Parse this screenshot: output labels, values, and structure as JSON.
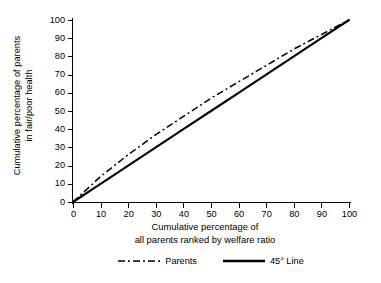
{
  "chart_data": {
    "type": "line",
    "title": "",
    "xlabel": "Cumulative percentage of all parents ranked by welfare ratio",
    "xlabel_line1": "Cumulative percentage of",
    "xlabel_line2": "all parents ranked by welfare ratio",
    "ylabel": "Cumulative percentage of parents in fair/poor health",
    "ylabel_line1": "Cumulative percentage of parents",
    "ylabel_line2": "in fair/poor health",
    "xlim": [
      0,
      100
    ],
    "ylim": [
      0,
      100
    ],
    "xticks": [
      "0",
      "10",
      "20",
      "30",
      "40",
      "50",
      "60",
      "70",
      "80",
      "90",
      "100"
    ],
    "yticks": [
      "0",
      "10",
      "20",
      "30",
      "40",
      "50",
      "60",
      "70",
      "80",
      "90",
      "100"
    ],
    "grid": false,
    "legend_position": "bottom-center",
    "x": [
      0,
      10,
      20,
      30,
      40,
      50,
      60,
      70,
      80,
      90,
      100
    ],
    "series": [
      {
        "name": "Parents",
        "style": "dash-dot",
        "color": "#000000",
        "values": [
          0,
          14,
          26,
          37,
          47,
          57,
          66,
          75,
          84,
          92,
          100
        ]
      },
      {
        "name": "45° Line",
        "style": "solid",
        "color": "#000000",
        "values": [
          0,
          10,
          20,
          30,
          40,
          50,
          60,
          70,
          80,
          90,
          100
        ]
      }
    ]
  },
  "legend": {
    "items": [
      {
        "label": "Parents",
        "swatch": "dash-dot-line-icon"
      },
      {
        "label": "45° Line",
        "swatch": "solid-line-icon"
      }
    ]
  }
}
